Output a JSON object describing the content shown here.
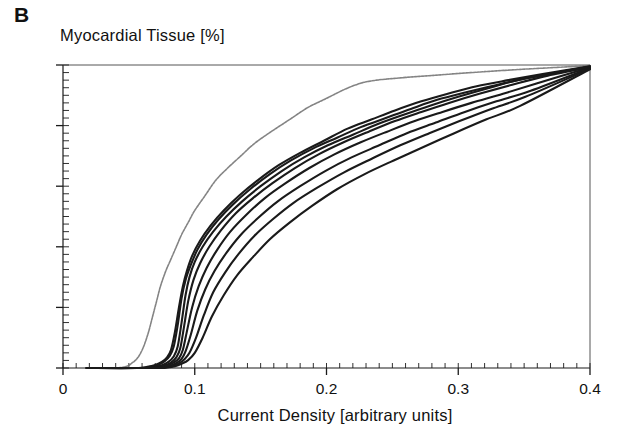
{
  "figure": {
    "panel_label": "B"
  },
  "chart_data": {
    "type": "line",
    "title": "",
    "ylabel": "Myocardial Tissue [%]",
    "xlabel": "Current Density [arbitrary units]",
    "xlim": [
      0,
      0.4
    ],
    "ylim": [
      0,
      100
    ],
    "grid": false,
    "legend": "none",
    "x_ticks": [
      {
        "value": 0,
        "label": "0"
      },
      {
        "value": 0.1,
        "label": "0.1"
      },
      {
        "value": 0.2,
        "label": "0.2"
      },
      {
        "value": 0.3,
        "label": "0.3"
      },
      {
        "value": 0.4,
        "label": "0.4"
      }
    ],
    "y_ticks": [
      {
        "value": 0,
        "label": "0%"
      },
      {
        "value": 20,
        "label": "20%"
      },
      {
        "value": 40,
        "label": "40%"
      },
      {
        "value": 60,
        "label": "60%"
      },
      {
        "value": 80,
        "label": "80%"
      },
      {
        "value": 100,
        "label": "100%"
      }
    ],
    "x_minor_tick_step": 0.01,
    "y_minor_tick_step": 2.5,
    "colors": {
      "axis": "#1a1a1a",
      "main_curves": "#1a1a1a",
      "outlier_curve": "#6e6e6e"
    },
    "series": [
      {
        "name": "outlier-left-curve",
        "style": "light-dotted",
        "color": "#6e6e6e",
        "x": [
          0.018,
          0.04,
          0.048,
          0.052,
          0.056,
          0.059,
          0.062,
          0.065,
          0.068,
          0.071,
          0.074,
          0.078,
          0.082,
          0.086,
          0.09,
          0.095,
          0.1,
          0.108,
          0.116,
          0.125,
          0.135,
          0.145,
          0.158,
          0.172,
          0.186,
          0.2,
          0.214,
          0.226,
          0.238,
          0.252,
          0.266,
          0.282,
          0.3,
          0.32,
          0.345,
          0.37,
          0.4
        ],
        "y": [
          0,
          0,
          0.5,
          1.5,
          3,
          5,
          8,
          12,
          17,
          22,
          27,
          32,
          36,
          40,
          44,
          48,
          52,
          57,
          62,
          66,
          70,
          74,
          78,
          82,
          86,
          89,
          92,
          94,
          95,
          95.6,
          96.1,
          96.6,
          97.2,
          97.8,
          98.5,
          99.1,
          99.8
        ]
      },
      {
        "name": "curve-1",
        "style": "solid",
        "color": "#1a1a1a",
        "x": [
          0.018,
          0.055,
          0.064,
          0.07,
          0.075,
          0.079,
          0.082,
          0.085,
          0.088,
          0.091,
          0.094,
          0.098,
          0.104,
          0.112,
          0.122,
          0.134,
          0.148,
          0.164,
          0.18,
          0.198,
          0.216,
          0.234,
          0.252,
          0.272,
          0.292,
          0.314,
          0.338,
          0.364,
          0.4
        ],
        "y": [
          0,
          0,
          0.4,
          1.0,
          2.0,
          3.5,
          6,
          12,
          20,
          27,
          32,
          37,
          42,
          47,
          52,
          57,
          62,
          67,
          71,
          75,
          79,
          82,
          85,
          88,
          90.5,
          93,
          95,
          97,
          99.6
        ]
      },
      {
        "name": "curve-2",
        "style": "solid",
        "color": "#1a1a1a",
        "x": [
          0.018,
          0.057,
          0.066,
          0.072,
          0.077,
          0.081,
          0.084,
          0.087,
          0.09,
          0.093,
          0.097,
          0.102,
          0.109,
          0.118,
          0.129,
          0.142,
          0.157,
          0.173,
          0.19,
          0.208,
          0.226,
          0.245,
          0.264,
          0.284,
          0.306,
          0.33,
          0.356,
          0.4
        ],
        "y": [
          0,
          0,
          0.4,
          1.0,
          2.2,
          4,
          7,
          14,
          23,
          29,
          34,
          39,
          44,
          49,
          54,
          59,
          64,
          68.5,
          72.5,
          76,
          79.5,
          82.5,
          85.5,
          88.5,
          91,
          93.5,
          96,
          99.5
        ]
      },
      {
        "name": "curve-3",
        "style": "solid",
        "color": "#1a1a1a",
        "x": [
          0.018,
          0.06,
          0.069,
          0.075,
          0.08,
          0.084,
          0.087,
          0.09,
          0.093,
          0.096,
          0.1,
          0.106,
          0.114,
          0.124,
          0.136,
          0.15,
          0.166,
          0.183,
          0.201,
          0.22,
          0.239,
          0.258,
          0.278,
          0.3,
          0.324,
          0.35,
          0.4
        ],
        "y": [
          0,
          0,
          0.3,
          0.9,
          2.0,
          3.8,
          7,
          15,
          24,
          30,
          35,
          40,
          45,
          50,
          55,
          60,
          65,
          69.5,
          73.5,
          77,
          80.5,
          83.5,
          86.5,
          89.5,
          92.5,
          95.5,
          99.4
        ]
      },
      {
        "name": "curve-4",
        "style": "solid",
        "color": "#1a1a1a",
        "x": [
          0.018,
          0.062,
          0.071,
          0.077,
          0.082,
          0.086,
          0.089,
          0.092,
          0.095,
          0.099,
          0.104,
          0.111,
          0.12,
          0.131,
          0.144,
          0.159,
          0.176,
          0.194,
          0.213,
          0.232,
          0.252,
          0.272,
          0.293,
          0.316,
          0.341,
          0.368,
          0.4
        ],
        "y": [
          0,
          0,
          0.3,
          0.8,
          1.8,
          3.5,
          6.5,
          14,
          22,
          29,
          34.5,
          40,
          45.5,
          51,
          56,
          61,
          66,
          70.5,
          74.5,
          78,
          81.5,
          84.5,
          87.5,
          90.5,
          93.5,
          96.5,
          99.3
        ]
      },
      {
        "name": "curve-5",
        "style": "solid",
        "color": "#1a1a1a",
        "x": [
          0.018,
          0.064,
          0.073,
          0.079,
          0.084,
          0.088,
          0.091,
          0.094,
          0.098,
          0.103,
          0.109,
          0.117,
          0.127,
          0.139,
          0.153,
          0.169,
          0.187,
          0.206,
          0.226,
          0.246,
          0.267,
          0.288,
          0.31,
          0.334,
          0.36,
          0.4
        ],
        "y": [
          0,
          0,
          0.3,
          0.8,
          1.8,
          3.2,
          6,
          12,
          20,
          27,
          33,
          39,
          45,
          50.5,
          56,
          61,
          66,
          70.5,
          74.5,
          78,
          81.5,
          84.5,
          87.5,
          90.5,
          94,
          99.2
        ]
      },
      {
        "name": "curve-6",
        "style": "solid",
        "color": "#1a1a1a",
        "x": [
          0.018,
          0.066,
          0.075,
          0.081,
          0.086,
          0.09,
          0.093,
          0.097,
          0.102,
          0.108,
          0.115,
          0.124,
          0.135,
          0.148,
          0.163,
          0.18,
          0.199,
          0.219,
          0.24,
          0.261,
          0.283,
          0.305,
          0.329,
          0.355,
          0.4
        ],
        "y": [
          0,
          0,
          0.2,
          0.7,
          1.6,
          3.0,
          5.5,
          11,
          19,
          26,
          32,
          38,
          44,
          49.5,
          55,
          60,
          65,
          69.5,
          73.5,
          77.5,
          81,
          84.5,
          88,
          91.5,
          99.0
        ]
      },
      {
        "name": "curve-7",
        "style": "solid",
        "color": "#1a1a1a",
        "x": [
          0.018,
          0.068,
          0.077,
          0.083,
          0.088,
          0.092,
          0.096,
          0.101,
          0.107,
          0.114,
          0.123,
          0.133,
          0.145,
          0.159,
          0.175,
          0.193,
          0.213,
          0.234,
          0.256,
          0.278,
          0.301,
          0.325,
          0.351,
          0.4
        ],
        "y": [
          0,
          0,
          0.2,
          0.6,
          1.5,
          2.8,
          5,
          10,
          17.5,
          25,
          31.5,
          37.5,
          43.5,
          49,
          54.5,
          59.5,
          64.5,
          69,
          73.5,
          77.5,
          81.5,
          85.5,
          89.5,
          98.8
        ]
      },
      {
        "name": "curve-8",
        "style": "solid",
        "color": "#1a1a1a",
        "x": [
          0.018,
          0.07,
          0.079,
          0.085,
          0.09,
          0.095,
          0.1,
          0.106,
          0.113,
          0.122,
          0.132,
          0.144,
          0.157,
          0.172,
          0.189,
          0.208,
          0.229,
          0.251,
          0.274,
          0.297,
          0.321,
          0.347,
          0.4
        ],
        "y": [
          0,
          0,
          0.2,
          0.6,
          1.4,
          2.6,
          5,
          10,
          17,
          24,
          30.5,
          36.5,
          42.5,
          48,
          53.5,
          59,
          64,
          68.5,
          73,
          77.5,
          82,
          86.5,
          98.6
        ]
      }
    ]
  }
}
